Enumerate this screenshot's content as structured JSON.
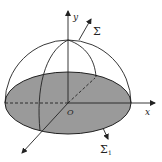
{
  "figure": {
    "type": "hemisphere-surface-diagram",
    "labels": {
      "y_axis": "y",
      "x_axis": "x",
      "origin": "O",
      "surface_upper": "Σ",
      "surface_lower": "Σ",
      "surface_lower_subscript": "1"
    },
    "colors": {
      "disk_fill": "#9a9a9a",
      "stroke": "#222222",
      "background": "#ffffff"
    }
  }
}
